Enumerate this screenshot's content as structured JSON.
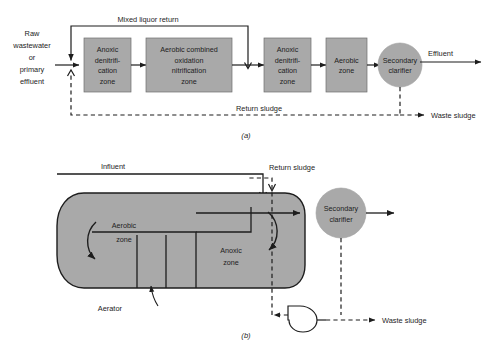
{
  "figure": {
    "title_note": "Biological nitrogen removal process flow diagrams",
    "colors": {
      "zone_fill": "#a9a9a9",
      "line": "#1d1d1d",
      "background": "#ffffff"
    }
  },
  "diagram_a": {
    "caption": "(a)",
    "inlet_label": [
      "Raw",
      "wastewater",
      "or",
      "primary",
      "effluent"
    ],
    "recycle_label": "Mixed liquor return",
    "return_label": "Return sludge",
    "waste_label": "Waste sludge",
    "effluent_label": "Effluent",
    "units": [
      {
        "name": "anoxic-denitrification-zone-1",
        "lines": [
          "Anoxic",
          "denitrifi-",
          "cation",
          "zone"
        ]
      },
      {
        "name": "aerobic-combined-zone",
        "lines": [
          "Aerobic combined",
          "oxidation",
          "nitrification",
          "zone"
        ]
      },
      {
        "name": "anoxic-denitrification-zone-2",
        "lines": [
          "Anoxic",
          "denitrifi-",
          "cation",
          "zone"
        ]
      },
      {
        "name": "aerobic-zone",
        "lines": [
          "Aerobic",
          "zone"
        ]
      }
    ],
    "clarifier": {
      "lines": [
        "Secondary",
        "clarifier"
      ]
    }
  },
  "diagram_b": {
    "caption": "(b)",
    "influent_label": "Influent",
    "return_label": "Return sludge",
    "waste_label": "Waste sludge",
    "aerator_label": "Aerator",
    "aerobic_zone": [
      "Aerobic",
      "zone"
    ],
    "anoxic_zone": [
      "Anoxic",
      "zone"
    ],
    "clarifier": {
      "lines": [
        "Secondary",
        "clarifier"
      ]
    },
    "pump_label": "pump-symbol"
  }
}
